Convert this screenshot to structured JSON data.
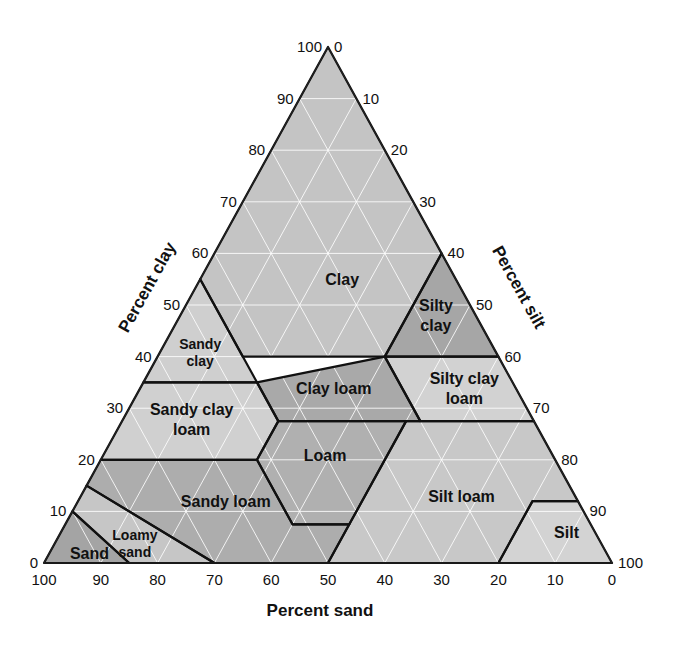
{
  "chart_data": {
    "type": "ternary",
    "title": "",
    "axes": {
      "clay": {
        "label": "Percent clay",
        "ticks": [
          0,
          10,
          20,
          30,
          40,
          50,
          60,
          70,
          80,
          90,
          100
        ],
        "side": "left"
      },
      "silt": {
        "label": "Percent silt",
        "ticks": [
          0,
          10,
          20,
          30,
          40,
          50,
          60,
          70,
          80,
          90,
          100
        ],
        "side": "right"
      },
      "sand": {
        "label": "Percent sand",
        "ticks": [
          100,
          90,
          80,
          70,
          60,
          50,
          40,
          30,
          20,
          10,
          0
        ],
        "side": "bottom"
      }
    },
    "grid": true,
    "grid_step": 10,
    "regions": [
      {
        "name": "Clay",
        "label": [
          "Clay"
        ],
        "shade": "#c4c4c4",
        "vertices_sand_silt_clay": [
          [
            45,
            15,
            40
          ],
          [
            20,
            40,
            40
          ],
          [
            0,
            40,
            60
          ],
          [
            0,
            0,
            100
          ],
          [
            45,
            0,
            55
          ]
        ]
      },
      {
        "name": "Sandy clay",
        "label": [
          "Sandy",
          "clay"
        ],
        "shade": "#cfcfcf",
        "vertices_sand_silt_clay": [
          [
            65,
            0,
            35
          ],
          [
            45,
            0,
            55
          ],
          [
            45,
            20,
            35
          ]
        ]
      },
      {
        "name": "Silty clay",
        "label": [
          "Silty",
          "clay"
        ],
        "shade": "#a6a6a6",
        "vertices_sand_silt_clay": [
          [
            0,
            40,
            60
          ],
          [
            20,
            40,
            40
          ],
          [
            0,
            60,
            40
          ]
        ]
      },
      {
        "name": "Sandy clay loam",
        "label": [
          "Sandy clay",
          "loam"
        ],
        "shade": "#d0d0d0",
        "vertices_sand_silt_clay": [
          [
            80,
            0,
            20
          ],
          [
            65,
            0,
            35
          ],
          [
            45,
            20,
            35
          ],
          [
            45,
            27.5,
            27.5
          ],
          [
            52.5,
            27.5,
            20
          ]
        ]
      },
      {
        "name": "Clay loam",
        "label": [
          "Clay loam"
        ],
        "shade": "#a9a9a9",
        "vertices_sand_silt_clay": [
          [
            45,
            20,
            35
          ],
          [
            20,
            40,
            40
          ],
          [
            20,
            52.5,
            27.5
          ],
          [
            45,
            27.5,
            27.5
          ]
        ]
      },
      {
        "name": "Silty clay loam",
        "label": [
          "Silty clay",
          "loam"
        ],
        "shade": "#d2d2d2",
        "vertices_sand_silt_clay": [
          [
            20,
            40,
            40
          ],
          [
            0,
            60,
            40
          ],
          [
            0,
            72.5,
            27.5
          ],
          [
            20,
            52.5,
            27.5
          ]
        ]
      },
      {
        "name": "Loam",
        "label": [
          "Loam"
        ],
        "shade": "#b0b0b0",
        "vertices_sand_silt_clay": [
          [
            52.5,
            27.5,
            20
          ],
          [
            45,
            27.5,
            27.5
          ],
          [
            22.5,
            50,
            27.5
          ],
          [
            42.5,
            50,
            7.5
          ],
          [
            52.5,
            40,
            7.5
          ]
        ]
      },
      {
        "name": "Sandy loam",
        "label": [
          "Sandy loam"
        ],
        "shade": "#adadad",
        "vertices_sand_silt_clay": [
          [
            85,
            0,
            15
          ],
          [
            80,
            0,
            20
          ],
          [
            52.5,
            27.5,
            20
          ],
          [
            52.5,
            40,
            7.5
          ],
          [
            42.5,
            50,
            7.5
          ],
          [
            50,
            50,
            0
          ],
          [
            70,
            30,
            0
          ]
        ]
      },
      {
        "name": "Silt loam",
        "label": [
          "Silt loam"
        ],
        "shade": "#c8c8c8",
        "vertices_sand_silt_clay": [
          [
            50,
            50,
            0
          ],
          [
            42.5,
            50,
            7.5
          ],
          [
            22.5,
            50,
            27.5
          ],
          [
            0,
            72.5,
            27.5
          ],
          [
            0,
            88,
            12
          ],
          [
            8,
            80,
            12
          ],
          [
            20,
            80,
            0
          ]
        ]
      },
      {
        "name": "Silt",
        "label": [
          "Silt"
        ],
        "shade": "#d3d3d3",
        "vertices_sand_silt_clay": [
          [
            20,
            80,
            0
          ],
          [
            8,
            80,
            12
          ],
          [
            0,
            88,
            12
          ],
          [
            0,
            100,
            0
          ]
        ]
      },
      {
        "name": "Loamy sand",
        "label": [
          "Loamy",
          "sand"
        ],
        "shade": "#c6c6c6",
        "vertices_sand_silt_clay": [
          [
            90,
            0,
            10
          ],
          [
            85,
            0,
            15
          ],
          [
            70,
            30,
            0
          ],
          [
            85,
            15,
            0
          ]
        ]
      },
      {
        "name": "Sand",
        "label": [
          "Sand"
        ],
        "shade": "#a4a4a4",
        "vertices_sand_silt_clay": [
          [
            100,
            0,
            0
          ],
          [
            90,
            0,
            10
          ],
          [
            85,
            15,
            0
          ]
        ]
      }
    ]
  },
  "labels": {
    "clay_axis": "Percent clay",
    "silt_axis": "Percent silt",
    "sand_axis": "Percent sand"
  }
}
